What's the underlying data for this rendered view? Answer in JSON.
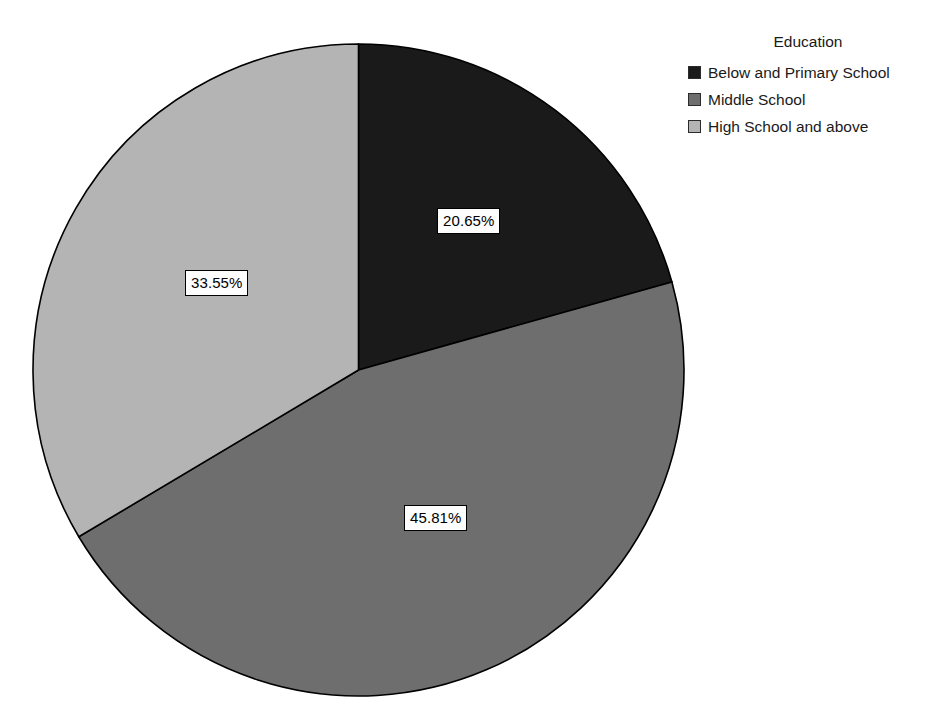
{
  "legend": {
    "title": "Education",
    "position": "right",
    "items": [
      {
        "label": "Below and Primary School",
        "color": "#1a1a1a"
      },
      {
        "label": "Middle School",
        "color": "#6e6e6e"
      },
      {
        "label": "High School and above",
        "color": "#b4b4b4"
      }
    ]
  },
  "labels": {
    "slice_0": "20.65%",
    "slice_1": "45.81%",
    "slice_2": "33.55%"
  },
  "chart_data": {
    "type": "pie",
    "title": "",
    "subtitle": "",
    "xlabel": "",
    "ylabel": "",
    "legend_title": "Education",
    "legend_position": "right",
    "grid": false,
    "start_angle_deg": 0,
    "direction": "clockwise",
    "categories": [
      "Below and Primary School",
      "Middle School",
      "High School and above"
    ],
    "values": [
      20.65,
      45.81,
      33.55
    ],
    "value_unit": "percent",
    "data_labels": [
      "20.65%",
      "45.81%",
      "33.55%"
    ],
    "colors": [
      "#1a1a1a",
      "#6e6e6e",
      "#b4b4b4"
    ],
    "slice_angles_deg": [
      74.34,
      164.92,
      120.78
    ]
  }
}
